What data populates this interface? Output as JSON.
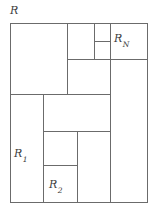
{
  "figure": {
    "kind": "rectangle-partition-diagram",
    "labels": {
      "outer": "R",
      "outer_base": "R",
      "last_region": "R",
      "last_region_sub": "N",
      "first_region": "R",
      "first_region_sub": "1",
      "second_region": "R",
      "second_region_sub": "2"
    },
    "style": {
      "stroke": "#6b6b6b",
      "stroke_width": 1,
      "fill": "#ffffff",
      "text_color": "#3c3c3c",
      "background": "#ffffff"
    },
    "outer_rect": {
      "x": 10,
      "y": 23,
      "width": 138,
      "height": 180
    },
    "segments": [
      {
        "name": "outer-top",
        "x1": 10,
        "y1": 23,
        "x2": 148,
        "y2": 23
      },
      {
        "name": "outer-right",
        "x1": 148,
        "y1": 23,
        "x2": 148,
        "y2": 203
      },
      {
        "name": "outer-bottom",
        "x1": 10,
        "y1": 203,
        "x2": 148,
        "y2": 203
      },
      {
        "name": "outer-left",
        "x1": 10,
        "y1": 23,
        "x2": 10,
        "y2": 203
      },
      {
        "name": "v-upper-left",
        "x1": 67,
        "y1": 23,
        "x2": 67,
        "y2": 94
      },
      {
        "name": "v-rn-left",
        "x1": 94,
        "y1": 23,
        "x2": 94,
        "y2": 59
      },
      {
        "name": "v-right-column",
        "x1": 110,
        "y1": 23,
        "x2": 110,
        "y2": 203
      },
      {
        "name": "v-lower-left",
        "x1": 43,
        "y1": 94,
        "x2": 43,
        "y2": 203
      },
      {
        "name": "v-lower-mid",
        "x1": 77,
        "y1": 131,
        "x2": 77,
        "y2": 203
      },
      {
        "name": "h-rn-split",
        "x1": 94,
        "y1": 41,
        "x2": 110,
        "y2": 41
      },
      {
        "name": "h-upper-right",
        "x1": 67,
        "y1": 59,
        "x2": 148,
        "y2": 59
      },
      {
        "name": "h-mid-band",
        "x1": 10,
        "y1": 94,
        "x2": 110,
        "y2": 94
      },
      {
        "name": "h-lower-band",
        "x1": 43,
        "y1": 131,
        "x2": 110,
        "y2": 131
      },
      {
        "name": "h-r2-top",
        "x1": 43,
        "y1": 165,
        "x2": 77,
        "y2": 165
      }
    ]
  }
}
